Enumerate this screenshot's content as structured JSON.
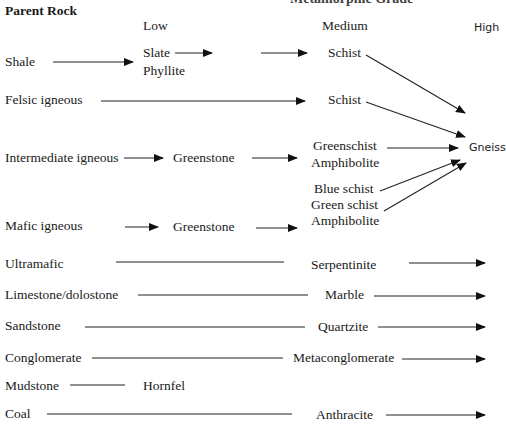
{
  "title_partial": "Metamorphic Grade",
  "header": {
    "parent_rock": "Parent Rock",
    "grades": [
      "Low",
      "Medium",
      "High"
    ]
  },
  "rows": [
    {
      "parent": "Shale",
      "low": [
        "Slate",
        "Phyllite"
      ],
      "medium": "Schist",
      "high": "Gneiss"
    },
    {
      "parent": "Felsic igneous",
      "medium": "Schist",
      "high": "Gneiss"
    },
    {
      "parent": "Intermediate igneous",
      "low": "Greenstone",
      "medium": [
        "Greenschist",
        "Amphibolite"
      ],
      "high": "Gneiss"
    },
    {
      "parent": "Mafic igneous",
      "low": "Greenstone",
      "medium": [
        "Blue schist",
        "Green schist",
        "Amphibolite"
      ],
      "high": "Gneiss"
    },
    {
      "parent": "Ultramafic",
      "medium": "Serpentinite"
    },
    {
      "parent": "Limestone/dolostone",
      "medium": "Marble"
    },
    {
      "parent": "Sandstone",
      "medium": "Quartzite"
    },
    {
      "parent": "Conglomerate",
      "medium": "Metaconglomerate"
    },
    {
      "parent": "Mudstone",
      "low": "Hornfel"
    },
    {
      "parent": "Coal",
      "medium": "Anthracite"
    }
  ],
  "labels": {
    "shale": "Shale",
    "slate": "Slate",
    "phyllite": "Phyllite",
    "schist1": "Schist",
    "felsic": "Felsic igneous",
    "schist2": "Schist",
    "intermediate": "Intermediate igneous",
    "greenstone1": "Greenstone",
    "greenschist": "Greenschist",
    "amphibolite1": "Amphibolite",
    "gneiss": "Gneiss",
    "blue_schist": "Blue schist",
    "green_schist": "Green schist",
    "amphibolite2": "Amphibolite",
    "mafic": "Mafic igneous",
    "greenstone2": "Greenstone",
    "ultramafic": "Ultramafic",
    "serpentinite": "Serpentinite",
    "limestone": "Limestone/dolostone",
    "marble": "Marble",
    "sandstone": "Sandstone",
    "quartzite": "Quartzite",
    "conglomerate": "Conglomerate",
    "metaconglomerate": "Metaconglomerate",
    "mudstone": "Mudstone",
    "hornfel": "Hornfel",
    "coal": "Coal",
    "anthracite": "Anthracite"
  }
}
